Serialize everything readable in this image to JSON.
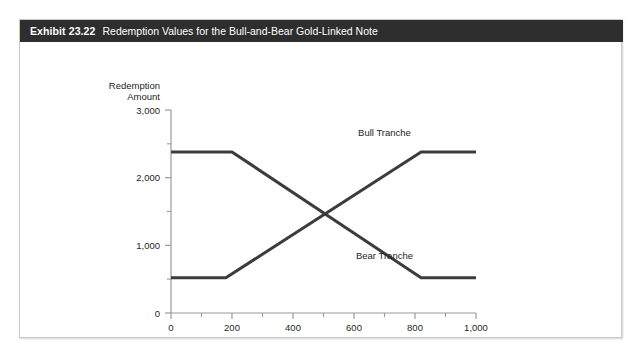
{
  "exhibit": {
    "number": "Exhibit 23.22",
    "title": "Redemption Values for the Bull-and-Bear Gold-Linked Note"
  },
  "style": {
    "header_bg": "#2e2e2e",
    "header_text": "#ffffff",
    "line_color": "#3c3c3c",
    "axis_color": "#9a9a9a",
    "frame_color": "#c9c9c9",
    "text_color": "#231f20"
  },
  "chart_data": {
    "type": "line",
    "title": "Redemption Values for the Bull-and-Bear Gold-Linked Note",
    "xlabel": "Gold Index",
    "ylabel": "Redemption Amount",
    "ylabel_line1": "Redemption",
    "ylabel_line2": "Amount",
    "xlim": [
      0,
      1000
    ],
    "ylim": [
      0,
      3000
    ],
    "grid": false,
    "legend_position": "inline-annotation",
    "x_ticks": [
      0,
      200,
      400,
      600,
      800,
      1000
    ],
    "x_tick_labels": [
      "0",
      "200",
      "400",
      "600",
      "800",
      "1,000"
    ],
    "x_minor_interval": 100,
    "y_ticks": [
      0,
      1000,
      2000,
      3000
    ],
    "y_tick_labels": [
      "0",
      "1,000",
      "2,000",
      "3,000"
    ],
    "y_minor_interval": 500,
    "series": [
      {
        "name": "Bull Tranche",
        "label": "Bull Tranche",
        "x": [
          0,
          180,
          820,
          1000
        ],
        "values": [
          520,
          520,
          2380,
          2380
        ],
        "label_x": 700,
        "label_y": 2620
      },
      {
        "name": "Bear Tranche",
        "label": "Bear Tranche",
        "x": [
          0,
          200,
          820,
          1000
        ],
        "values": [
          2380,
          2380,
          520,
          520
        ],
        "label_x": 700,
        "label_y": 800
      }
    ],
    "crossover": {
      "x": 500,
      "y": 1380
    }
  }
}
